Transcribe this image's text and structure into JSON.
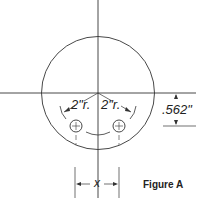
{
  "figure": {
    "caption": "Figure A",
    "labels": {
      "radius_left": "2\"r.",
      "radius_right": "2\"r.",
      "vertical_offset": ".562\"",
      "hole_spacing": "x"
    }
  },
  "colors": {
    "line": "#333333",
    "background": "#ffffff"
  }
}
